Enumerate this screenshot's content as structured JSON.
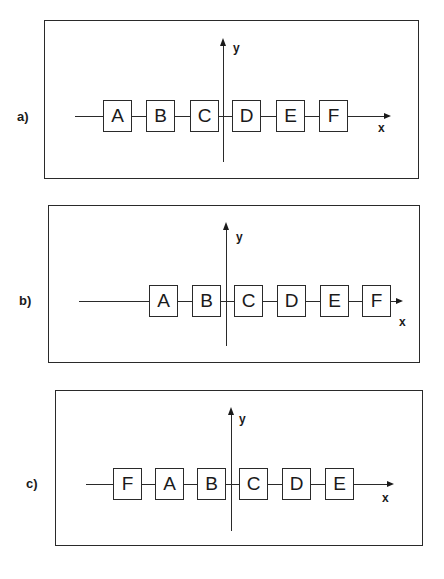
{
  "figure": {
    "colors": {
      "background": "#ffffff",
      "ink": "#1a1a1a"
    },
    "axis_labels": {
      "x": "x",
      "y": "y"
    }
  },
  "panels": [
    {
      "label": "a)",
      "blocks": [
        "A",
        "B",
        "C",
        "D",
        "E",
        "F"
      ],
      "left_of_y_axis": [
        "A",
        "B",
        "C"
      ],
      "right_of_y_axis": [
        "D",
        "E",
        "F"
      ]
    },
    {
      "label": "b)",
      "blocks": [
        "A",
        "B",
        "C",
        "D",
        "E",
        "F"
      ],
      "left_of_y_axis": [
        "A",
        "B"
      ],
      "right_of_y_axis": [
        "C",
        "D",
        "E",
        "F"
      ]
    },
    {
      "label": "c)",
      "blocks": [
        "F",
        "A",
        "B",
        "C",
        "D",
        "E"
      ],
      "left_of_y_axis": [
        "F",
        "A",
        "B"
      ],
      "right_of_y_axis": [
        "C",
        "D",
        "E"
      ]
    }
  ]
}
